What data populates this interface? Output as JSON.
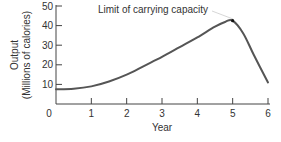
{
  "chart_data": {
    "type": "line",
    "title": "",
    "annotation": "Limit of carrying capacity",
    "xlabel": "Year",
    "ylabel": "Output",
    "ylabel_sub": "(Millions of calories)",
    "x_ticks": [
      "0",
      "1",
      "2",
      "3",
      "4",
      "5",
      "6"
    ],
    "y_ticks": [
      "10",
      "20",
      "30",
      "40",
      "50"
    ],
    "xlim": [
      0,
      6
    ],
    "ylim": [
      0,
      50
    ],
    "grid": false,
    "legend": null,
    "series": [
      {
        "name": "Output",
        "x": [
          0,
          0.5,
          1,
          1.5,
          2,
          2.5,
          3,
          3.5,
          4,
          4.5,
          4.8,
          5,
          5.3,
          5.6,
          6
        ],
        "values": [
          7.5,
          7.8,
          9,
          11.5,
          15,
          19.5,
          24,
          29,
          34,
          39.5,
          42,
          42.5,
          36,
          25,
          11
        ],
        "color": "#555555"
      }
    ],
    "peak_marker": {
      "x": 5,
      "y": 42.5
    }
  }
}
